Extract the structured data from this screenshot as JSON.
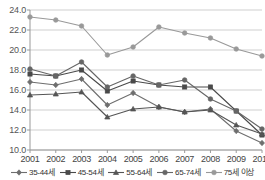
{
  "chart_data": {
    "type": "line",
    "title": "",
    "subtitle": "",
    "xlabel": "",
    "ylabel": "",
    "categories": [
      "2001",
      "2002",
      "2003",
      "2004",
      "2005",
      "2006",
      "2007",
      "2008",
      "2009",
      "2010"
    ],
    "x": [
      2001,
      2002,
      2003,
      2004,
      2005,
      2006,
      2007,
      2008,
      2009,
      2010
    ],
    "ylim": [
      10.0,
      24.0
    ],
    "yticks": [
      "10.0",
      "12.0",
      "14.0",
      "16.0",
      "18.0",
      "20.0",
      "22.0",
      "24.0"
    ],
    "ytick_values": [
      10.0,
      12.0,
      14.0,
      16.0,
      18.0,
      20.0,
      22.0,
      24.0
    ],
    "grid": "horizontal",
    "legend_position": "bottom",
    "series": [
      {
        "name": "35-44세",
        "marker": "diamond",
        "color": "#6e6e6e",
        "values": [
          16.8,
          16.5,
          17.1,
          14.5,
          15.7,
          14.3,
          13.8,
          14.1,
          11.9,
          10.7
        ]
      },
      {
        "name": "45-54세",
        "marker": "square",
        "color": "#4a4a4a",
        "values": [
          17.6,
          17.4,
          18.0,
          15.9,
          16.9,
          16.5,
          16.3,
          16.3,
          13.9,
          11.5
        ]
      },
      {
        "name": "55-64세",
        "marker": "triangle",
        "color": "#555555",
        "values": [
          15.5,
          15.6,
          15.8,
          13.3,
          14.1,
          14.3,
          13.8,
          14.0,
          12.5,
          11.6
        ]
      },
      {
        "name": "65-74세",
        "marker": "circle",
        "color": "#666666",
        "values": [
          18.1,
          17.4,
          18.8,
          16.3,
          17.4,
          16.5,
          17.0,
          15.1,
          13.9,
          12.1
        ]
      },
      {
        "name": "75세 이상",
        "marker": "circle",
        "color": "#999999",
        "values": [
          23.3,
          23.0,
          22.4,
          19.5,
          20.3,
          22.3,
          21.7,
          21.2,
          20.1,
          19.4
        ]
      }
    ]
  },
  "axis": {
    "y_labels": [
      "24.0",
      "22.0",
      "20.0",
      "18.0",
      "16.0",
      "14.0",
      "12.0",
      "10.0"
    ],
    "x_labels": [
      "2001",
      "2002",
      "2003",
      "2004",
      "2005",
      "2006",
      "2007",
      "2008",
      "2009",
      "2010"
    ]
  },
  "legend": {
    "items": [
      {
        "label": "35-44세",
        "marker": "diamond",
        "color": "#6e6e6e"
      },
      {
        "label": "45-54세",
        "marker": "square",
        "color": "#4a4a4a"
      },
      {
        "label": "55-64세",
        "marker": "triangle",
        "color": "#555555"
      },
      {
        "label": "65-74세",
        "marker": "circle",
        "color": "#666666"
      },
      {
        "label": "75세 이상",
        "marker": "circle",
        "color": "#999999"
      }
    ]
  },
  "colors": {
    "grid": "#cfcfcf",
    "axis": "#9a9a9a",
    "background": "#ffffff",
    "text": "#444444"
  }
}
